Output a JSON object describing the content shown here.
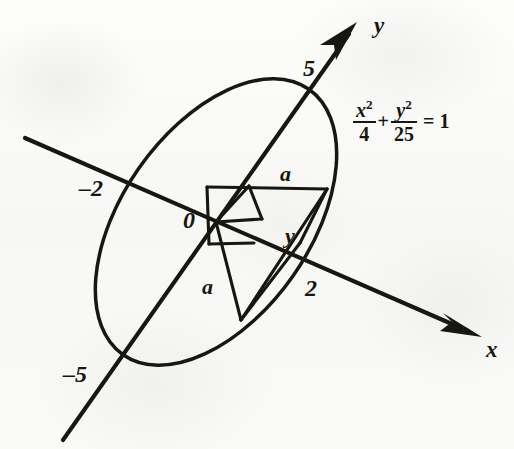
{
  "figure": {
    "kind": "geometry-diagram",
    "background_color": "#fbfbfa",
    "ink_color": "#17160f"
  },
  "axes": {
    "x_axis": {
      "label": "x",
      "label_pos": {
        "x": 486,
        "y": 340
      },
      "line": {
        "x1": 25,
        "y1": 138,
        "x2": 470,
        "y2": 332
      },
      "arrow_tip": {
        "x": 482,
        "y": 337
      }
    },
    "y_axis": {
      "label": "y",
      "label_pos": {
        "x": 374,
        "y": 16
      },
      "line": {
        "x1": 63,
        "y1": 440,
        "x2": 349,
        "y2": 33
      },
      "arrow_tip": {
        "x": 357,
        "y": 22
      }
    }
  },
  "ticks": [
    {
      "name": "y-positive-vertex",
      "label": "5",
      "pos": {
        "x": 303,
        "y": 56
      }
    },
    {
      "name": "x-negative-vertex",
      "label": "–2",
      "pos": {
        "x": 79,
        "y": 177
      }
    },
    {
      "name": "origin",
      "label": "0",
      "pos": {
        "x": 183,
        "y": 208
      }
    },
    {
      "name": "x-positive-vertex",
      "label": "2",
      "pos": {
        "x": 305,
        "y": 276
      }
    },
    {
      "name": "y-negative-vertex",
      "label": "–5",
      "pos": {
        "x": 63,
        "y": 362
      }
    }
  ],
  "segment_labels": [
    {
      "name": "upper-a",
      "label": "a",
      "pos": {
        "x": 280,
        "y": 164
      }
    },
    {
      "name": "lower-a",
      "label": "a",
      "pos": {
        "x": 202,
        "y": 277
      }
    },
    {
      "name": "y-segment",
      "label": "y",
      "pos": {
        "x": 285,
        "y": 226
      }
    }
  ],
  "equation": {
    "name": "ellipse-equation",
    "text": "x²/4 + y²/25 = 1",
    "term1": {
      "numerator": "x",
      "numerator_exponent": "2",
      "denominator": "4"
    },
    "operator": "+",
    "term2": {
      "numerator": "y",
      "numerator_exponent": "2",
      "denominator": "25"
    },
    "equals": "=",
    "right_hand_side": "1"
  },
  "geometry": {
    "ellipse": {
      "center": {
        "x": 216,
        "y": 222
      },
      "semi_major": 162,
      "semi_minor": 94,
      "rotation_deg": -55
    },
    "origin_point": {
      "x": 216,
      "y": 222
    },
    "construction_points": {
      "top_left": {
        "x": 207,
        "y": 187
      },
      "top_mid": {
        "x": 249,
        "y": 186
      },
      "top_right": {
        "x": 327,
        "y": 189
      },
      "mid_right": {
        "x": 262,
        "y": 217
      },
      "lower_left": {
        "x": 209,
        "y": 244
      },
      "lower_mid": {
        "x": 254,
        "y": 243
      },
      "triangle_apex": {
        "x": 241,
        "y": 320
      },
      "ellipse_x_crossing": {
        "x": 302,
        "y": 245
      }
    }
  }
}
